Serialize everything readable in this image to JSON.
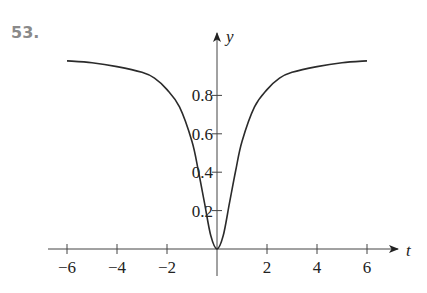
{
  "problem": {
    "number": "53."
  },
  "chart_data": {
    "type": "line",
    "title": "",
    "xlabel": "t",
    "ylabel": "y",
    "xlim": [
      -6,
      6
    ],
    "ylim": [
      0,
      1
    ],
    "grid": false,
    "legend": null,
    "x_ticks": [
      -6,
      -4,
      -2,
      2,
      4,
      6
    ],
    "x_tick_labels": [
      "−6",
      "−4",
      "−2",
      "2",
      "4",
      "6"
    ],
    "y_ticks": [
      0.2,
      0.4,
      0.6,
      0.8
    ],
    "y_tick_labels": [
      "0.2",
      "0.4",
      "0.6",
      "0.8"
    ],
    "series": [
      {
        "name": "y(t)",
        "x": [
          -6,
          -5,
          -4,
          -3,
          -2.5,
          -2,
          -1.5,
          -1,
          -0.75,
          -0.5,
          -0.25,
          0,
          0.25,
          0.5,
          0.75,
          1,
          1.5,
          2,
          2.5,
          3,
          4,
          5,
          6
        ],
        "values": [
          0.98,
          0.97,
          0.95,
          0.92,
          0.89,
          0.83,
          0.74,
          0.56,
          0.41,
          0.24,
          0.07,
          0,
          0.07,
          0.24,
          0.41,
          0.56,
          0.74,
          0.83,
          0.89,
          0.92,
          0.95,
          0.97,
          0.98
        ]
      }
    ]
  },
  "colors": {
    "curve": "#2b2b2b",
    "axis": "#444444",
    "number": "#8a8a8a"
  }
}
